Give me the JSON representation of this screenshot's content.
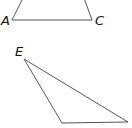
{
  "diagram": {
    "type": "geometry-triangles",
    "triangles": [
      {
        "name": "upper-triangle",
        "labels": {
          "A": "A",
          "C": "C"
        },
        "vertices": {
          "A": [
            12,
            20
          ],
          "C": [
            92,
            20
          ]
        }
      },
      {
        "name": "lower-triangle",
        "labels": {
          "E": "E",
          "D": "D"
        },
        "vertices": {
          "E": [
            24,
            59
          ],
          "D": [
            62,
            123
          ],
          "F": [
            128,
            122
          ]
        }
      }
    ]
  }
}
